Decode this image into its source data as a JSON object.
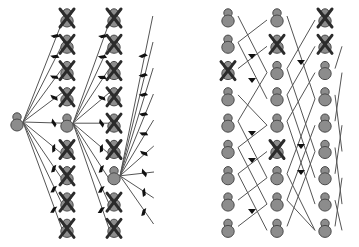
{
  "colors": {
    "node_fill": "#8c8c8c",
    "node_stroke": "#4a4a4a",
    "cross": "#2b2b2b",
    "edge": "#555555",
    "marker": "#111111",
    "background": "#ffffff"
  },
  "left_diagram": {
    "name": "fan-out broadcast",
    "source_alive": true,
    "columns": [
      {
        "alive": [
          false,
          false,
          false,
          false,
          true,
          false,
          false,
          false,
          false
        ]
      },
      {
        "alive": [
          false,
          false,
          false,
          false,
          false,
          false,
          true,
          false,
          false
        ]
      }
    ],
    "terminal_fan_count": 9
  },
  "right_diagram": {
    "name": "mesh exchange",
    "columns": [
      {
        "alive": [
          true,
          true,
          false,
          true,
          true,
          true,
          true,
          true,
          true
        ]
      },
      {
        "alive": [
          true,
          false,
          true,
          true,
          true,
          false,
          true,
          true,
          true
        ]
      },
      {
        "alive": [
          false,
          false,
          true,
          true,
          true,
          true,
          true,
          true,
          true
        ]
      }
    ],
    "links": [
      [
        0,
        0,
        1,
        2
      ],
      [
        0,
        1,
        1,
        0
      ],
      [
        0,
        1,
        1,
        3
      ],
      [
        0,
        2,
        1,
        1
      ],
      [
        0,
        3,
        1,
        4
      ],
      [
        0,
        4,
        1,
        2
      ],
      [
        0,
        4,
        1,
        6
      ],
      [
        0,
        5,
        1,
        4
      ],
      [
        0,
        5,
        1,
        7
      ],
      [
        0,
        6,
        1,
        5
      ],
      [
        0,
        6,
        1,
        8
      ],
      [
        0,
        7,
        1,
        6
      ],
      [
        0,
        8,
        1,
        7
      ],
      [
        1,
        0,
        2,
        3
      ],
      [
        1,
        2,
        2,
        0
      ],
      [
        1,
        2,
        2,
        5
      ],
      [
        1,
        3,
        2,
        6
      ],
      [
        1,
        3,
        2,
        1
      ],
      [
        1,
        4,
        2,
        7
      ],
      [
        1,
        4,
        2,
        2
      ],
      [
        1,
        6,
        2,
        8
      ],
      [
        1,
        6,
        2,
        3
      ],
      [
        1,
        7,
        2,
        4
      ],
      [
        1,
        8,
        2,
        5
      ],
      [
        1,
        7,
        2,
        8
      ],
      [
        2,
        2,
        3,
        1
      ],
      [
        2,
        3,
        3,
        5
      ],
      [
        2,
        4,
        3,
        2
      ],
      [
        2,
        5,
        3,
        7
      ],
      [
        2,
        6,
        3,
        4
      ],
      [
        2,
        7,
        3,
        8
      ],
      [
        2,
        8,
        3,
        6
      ]
    ]
  }
}
